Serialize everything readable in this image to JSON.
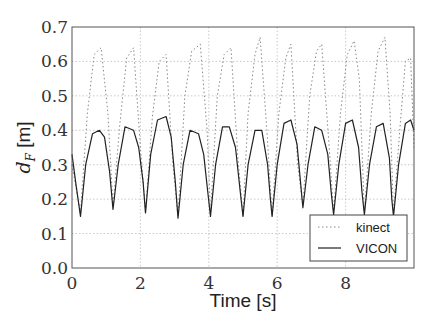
{
  "chart_data": {
    "type": "line",
    "title": "",
    "xlabel": "Time [s]",
    "ylabel": "d_F [m]",
    "ylabel_main": "d",
    "ylabel_sub": "F",
    "ylabel_unit": " [m]",
    "xlim": [
      0,
      10
    ],
    "ylim": [
      0.0,
      0.7
    ],
    "x_ticks": [
      0,
      2,
      4,
      6,
      8
    ],
    "x_tick_labels": [
      "0",
      "2",
      "4",
      "6",
      "8"
    ],
    "y_ticks": [
      0.0,
      0.1,
      0.2,
      0.3,
      0.4,
      0.5,
      0.6,
      0.7
    ],
    "y_tick_labels": [
      "0.0",
      "0.1",
      "0.2",
      "0.3",
      "0.4",
      "0.5",
      "0.6",
      "0.7"
    ],
    "grid": true,
    "legend_position": "lower right",
    "series": [
      {
        "name": "kinect",
        "style": "dotted",
        "color": "#888888",
        "x": [
          0.0,
          0.25,
          0.45,
          0.65,
          0.85,
          1.05,
          1.2,
          1.4,
          1.6,
          1.8,
          2.0,
          2.15,
          2.35,
          2.55,
          2.75,
          2.95,
          3.1,
          3.3,
          3.5,
          3.75,
          3.95,
          4.05,
          4.25,
          4.45,
          4.65,
          4.85,
          5.0,
          5.15,
          5.35,
          5.5,
          5.7,
          5.85,
          6.05,
          6.25,
          6.4,
          6.6,
          6.75,
          6.95,
          7.15,
          7.3,
          7.5,
          7.65,
          7.85,
          8.05,
          8.25,
          8.4,
          8.55,
          8.75,
          8.95,
          9.15,
          9.3,
          9.4,
          9.6,
          9.75,
          9.9,
          10.0
        ],
        "y": [
          0.3,
          0.16,
          0.45,
          0.62,
          0.64,
          0.45,
          0.18,
          0.42,
          0.61,
          0.64,
          0.35,
          0.16,
          0.44,
          0.6,
          0.62,
          0.3,
          0.15,
          0.5,
          0.63,
          0.65,
          0.4,
          0.16,
          0.5,
          0.62,
          0.64,
          0.32,
          0.15,
          0.45,
          0.62,
          0.67,
          0.4,
          0.15,
          0.45,
          0.61,
          0.65,
          0.3,
          0.18,
          0.5,
          0.63,
          0.65,
          0.38,
          0.16,
          0.45,
          0.62,
          0.66,
          0.55,
          0.16,
          0.45,
          0.63,
          0.67,
          0.45,
          0.16,
          0.42,
          0.6,
          0.61,
          0.35
        ]
      },
      {
        "name": "VICON",
        "style": "solid",
        "color": "#222222",
        "x": [
          0.0,
          0.12,
          0.25,
          0.4,
          0.6,
          0.8,
          0.95,
          1.1,
          1.2,
          1.35,
          1.55,
          1.8,
          1.95,
          2.08,
          2.15,
          2.3,
          2.5,
          2.75,
          2.9,
          3.02,
          3.1,
          3.25,
          3.45,
          3.7,
          3.85,
          3.97,
          4.05,
          4.2,
          4.4,
          4.6,
          4.78,
          4.92,
          5.0,
          5.15,
          5.35,
          5.55,
          5.72,
          5.8,
          5.85,
          6.0,
          6.2,
          6.4,
          6.58,
          6.68,
          6.75,
          6.9,
          7.1,
          7.3,
          7.48,
          7.58,
          7.65,
          7.8,
          8.0,
          8.2,
          8.38,
          8.48,
          8.55,
          8.7,
          8.9,
          9.1,
          9.28,
          9.35,
          9.4,
          9.55,
          9.75,
          9.9,
          10.0
        ],
        "y": [
          0.33,
          0.24,
          0.15,
          0.3,
          0.39,
          0.4,
          0.38,
          0.28,
          0.17,
          0.3,
          0.41,
          0.4,
          0.35,
          0.25,
          0.16,
          0.33,
          0.43,
          0.44,
          0.38,
          0.25,
          0.145,
          0.3,
          0.4,
          0.39,
          0.33,
          0.22,
          0.15,
          0.3,
          0.41,
          0.41,
          0.35,
          0.22,
          0.15,
          0.3,
          0.4,
          0.4,
          0.3,
          0.2,
          0.15,
          0.3,
          0.42,
          0.43,
          0.36,
          0.25,
          0.175,
          0.3,
          0.41,
          0.4,
          0.33,
          0.22,
          0.155,
          0.3,
          0.42,
          0.43,
          0.35,
          0.22,
          0.155,
          0.3,
          0.41,
          0.42,
          0.32,
          0.2,
          0.15,
          0.3,
          0.42,
          0.43,
          0.4
        ]
      }
    ]
  },
  "legend": {
    "items": [
      {
        "label": "kinect",
        "style": "dotted"
      },
      {
        "label": "VICON",
        "style": "solid"
      }
    ]
  }
}
